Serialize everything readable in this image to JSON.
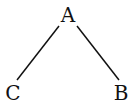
{
  "diagram": {
    "type": "tree",
    "nodes": [
      {
        "id": "A",
        "label": "A",
        "x": 68,
        "y": 22
      },
      {
        "id": "C",
        "label": "C",
        "x": 13,
        "y": 100
      },
      {
        "id": "B",
        "label": "B",
        "x": 121,
        "y": 100
      }
    ],
    "edges": [
      {
        "from": "A",
        "to": "C"
      },
      {
        "from": "A",
        "to": "B"
      }
    ],
    "line_color": "#111111"
  }
}
